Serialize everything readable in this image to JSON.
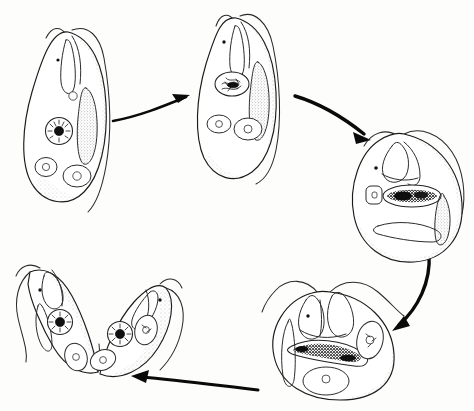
{
  "figure": {
    "style": "hand-drawn ink line illustration",
    "background_color": "#fdfdfc",
    "ink_color": "#1a1a1a",
    "width": 474,
    "height": 411,
    "text_labels_present": false,
    "label_text": ""
  },
  "cycle": {
    "direction": "clockwise",
    "stage_count": 5,
    "arrow_count": 4
  },
  "stages": [
    {
      "id": "stage-1",
      "name": "interphase-trophozoite-upper-left",
      "position": "upper-left",
      "cx": 70,
      "cy": 125,
      "description": "elongated teardrop trophozoite with single nucleus, two vacuoles and axostyle",
      "nucleus_count": 1,
      "vacuole_count": 2,
      "flagella_visible": true
    },
    {
      "id": "stage-2",
      "name": "early-prophase-top",
      "position": "top-center",
      "cx": 240,
      "cy": 82,
      "description": "teardrop cell with condensing granular nucleus and two vacuoles",
      "nucleus_count": 1,
      "vacuole_count": 2,
      "flagella_visible": true
    },
    {
      "id": "stage-3",
      "name": "metaphase-rounded-right",
      "position": "right",
      "cx": 405,
      "cy": 192,
      "description": "rounded cell with dark elongated metaphase plate across the middle",
      "nucleus_count": 1,
      "vacuole_count": 1,
      "flagella_visible": true
    },
    {
      "id": "stage-4",
      "name": "anaphase-telophase-lower-right",
      "position": "lower-right",
      "cx": 330,
      "cy": 340,
      "description": "rounded cell with elongating separating chromatin band and duplicated organelles",
      "nucleus_count": 2,
      "vacuole_count": 2,
      "flagella_visible": true
    },
    {
      "id": "stage-5",
      "name": "cytokinesis-daughter-pair-lower-left",
      "position": "lower-left",
      "cx": 90,
      "cy": 325,
      "description": "two V-joined daughter cells each with its own nucleus and vacuoles, still attached posteriorly",
      "nucleus_count": 2,
      "vacuole_count": 3,
      "flagella_visible": true
    }
  ],
  "arrows": [
    {
      "id": "arrow-1",
      "name": "arrow-stage1-to-stage2",
      "from": "stage-1",
      "to": "stage-2",
      "shape": "straight-slight-curve",
      "direction": "up-right"
    },
    {
      "id": "arrow-2",
      "name": "arrow-stage2-to-stage3",
      "from": "stage-2",
      "to": "stage-3",
      "shape": "curved-arc",
      "direction": "down-right"
    },
    {
      "id": "arrow-3",
      "name": "arrow-stage3-to-stage4",
      "from": "stage-3",
      "to": "stage-4",
      "shape": "curved-arc",
      "direction": "down-left"
    },
    {
      "id": "arrow-4",
      "name": "arrow-stage4-to-stage5",
      "from": "stage-4",
      "to": "stage-5",
      "shape": "curved-arc",
      "direction": "left"
    }
  ]
}
